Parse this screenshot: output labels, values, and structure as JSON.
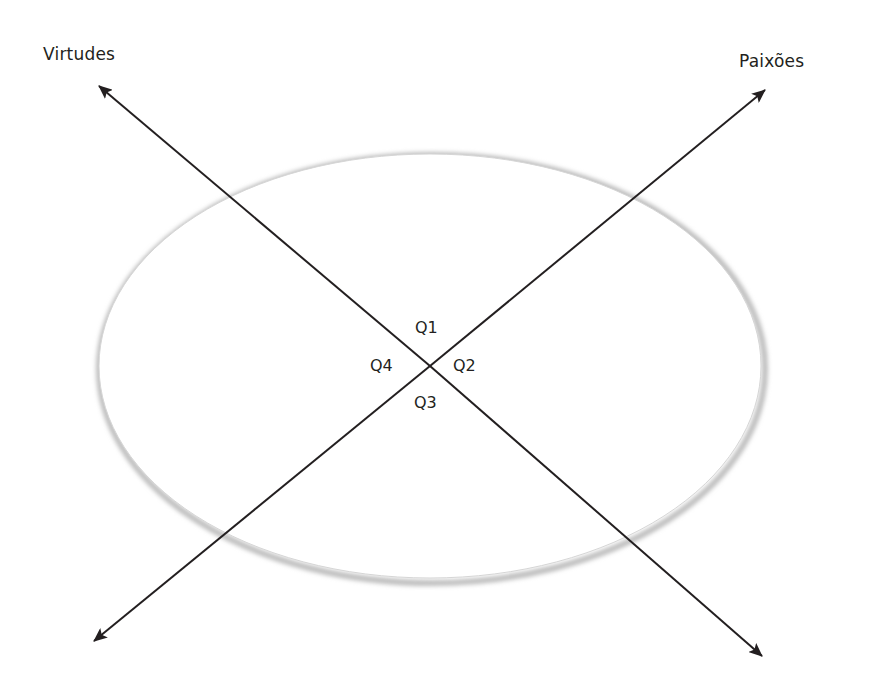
{
  "diagram": {
    "type": "crossed-axes-over-ellipse",
    "axes": [
      {
        "id": "virtudes",
        "label": "Virtudes",
        "direction": "top-left to bottom-right",
        "start": [
          99,
          86
        ],
        "end": [
          762,
          656
        ]
      },
      {
        "id": "paixoes",
        "label": "Paixões",
        "direction": "top-right to bottom-left",
        "start": [
          765,
          90
        ],
        "end": [
          94,
          641
        ]
      }
    ],
    "ellipse": {
      "cx": 430,
      "cy": 366,
      "rx": 332,
      "ry": 213,
      "stroke_color": "#c8c8c8",
      "fill": "#ffffff"
    },
    "quadrants": [
      {
        "id": "q1",
        "label": "Q1",
        "position": "top"
      },
      {
        "id": "q2",
        "label": "Q2",
        "position": "right"
      },
      {
        "id": "q3",
        "label": "Q3",
        "position": "bottom"
      },
      {
        "id": "q4",
        "label": "Q4",
        "position": "left"
      }
    ],
    "line_color": "#231f20"
  }
}
